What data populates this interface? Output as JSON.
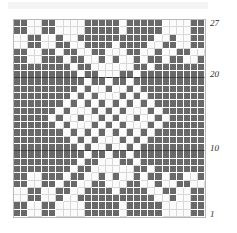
{
  "chart": {
    "columns": 27,
    "rows": 27,
    "colors": {
      "filled": "#696969",
      "empty": "#fbfbfb",
      "gridline": "#ffffff",
      "border": "#b9b9b9",
      "rule": "#3c3c3c",
      "label_text": "#2b2b2b"
    },
    "row_labels": [
      {
        "text": "27",
        "row": 27
      },
      {
        "text": "20",
        "row": 20
      },
      {
        "text": "10",
        "row": 10
      },
      {
        "text": "1",
        "row": 1
      }
    ],
    "emphasis_rule_rows": [
      20,
      10
    ],
    "legend": {
      "filled_meaning": "main colour stitch",
      "empty_meaning": "contrast colour stitch"
    }
  },
  "chart_data": {
    "type": "heatmap",
    "xlabel": "",
    "ylabel": "",
    "x": [
      1,
      2,
      3,
      4,
      5,
      6,
      7,
      8,
      9,
      10,
      11,
      12,
      13,
      14,
      15,
      16,
      17,
      18,
      19,
      20,
      21,
      22,
      23,
      24,
      25,
      26,
      27
    ],
    "categories": [
      1,
      2,
      3,
      4,
      5,
      6,
      7,
      8,
      9,
      10,
      11,
      12,
      13,
      14,
      15,
      16,
      17,
      18,
      19,
      20,
      21,
      22,
      23,
      24,
      25,
      26,
      27
    ],
    "tick_labels_y": [
      "1",
      "10",
      "20",
      "27"
    ],
    "grid": true,
    "legend_position": "none",
    "values_note": "1 = filled (dark) stitch, 0 = empty (light) stitch. Rows listed top (row 27) to bottom (row 1).",
    "values": [
      [
        1,
        1,
        0,
        0,
        1,
        1,
        0,
        0,
        0,
        0,
        1,
        1,
        1,
        1,
        1,
        0,
        1,
        1,
        1,
        1,
        1,
        0,
        0,
        0,
        0,
        1,
        1
      ],
      [
        1,
        1,
        0,
        0,
        1,
        1,
        0,
        0,
        0,
        0,
        1,
        1,
        1,
        1,
        1,
        0,
        1,
        1,
        1,
        1,
        1,
        0,
        0,
        0,
        0,
        1,
        1
      ],
      [
        0,
        0,
        1,
        1,
        0,
        0,
        1,
        0,
        0,
        1,
        1,
        1,
        1,
        1,
        1,
        1,
        1,
        1,
        1,
        1,
        0,
        0,
        1,
        0,
        0,
        1,
        1
      ],
      [
        0,
        0,
        1,
        1,
        0,
        0,
        1,
        1,
        0,
        0,
        1,
        1,
        1,
        1,
        0,
        1,
        1,
        1,
        1,
        0,
        0,
        1,
        1,
        0,
        0,
        1,
        1
      ],
      [
        1,
        1,
        0,
        0,
        1,
        1,
        0,
        1,
        1,
        0,
        0,
        1,
        1,
        0,
        0,
        0,
        1,
        1,
        0,
        0,
        1,
        0,
        0,
        1,
        1,
        0,
        0
      ],
      [
        1,
        1,
        0,
        0,
        1,
        1,
        1,
        0,
        1,
        1,
        0,
        0,
        1,
        0,
        1,
        0,
        0,
        1,
        0,
        1,
        1,
        0,
        1,
        1,
        0,
        0,
        1
      ],
      [
        1,
        1,
        1,
        1,
        1,
        1,
        1,
        1,
        0,
        1,
        1,
        0,
        0,
        0,
        0,
        0,
        0,
        1,
        1,
        0,
        1,
        1,
        1,
        1,
        1,
        1,
        1
      ],
      [
        1,
        1,
        1,
        1,
        1,
        1,
        1,
        1,
        1,
        0,
        1,
        1,
        0,
        0,
        0,
        1,
        1,
        0,
        1,
        1,
        1,
        1,
        1,
        1,
        1,
        1,
        1
      ],
      [
        1,
        1,
        1,
        1,
        1,
        1,
        1,
        1,
        1,
        1,
        0,
        1,
        1,
        0,
        1,
        1,
        0,
        1,
        1,
        1,
        1,
        1,
        1,
        1,
        1,
        1,
        1
      ],
      [
        1,
        1,
        1,
        1,
        1,
        1,
        1,
        1,
        1,
        0,
        1,
        0,
        0,
        1,
        0,
        0,
        1,
        0,
        1,
        1,
        1,
        1,
        1,
        1,
        1,
        1,
        1
      ],
      [
        1,
        1,
        1,
        1,
        1,
        1,
        1,
        1,
        0,
        1,
        0,
        1,
        0,
        0,
        0,
        1,
        0,
        1,
        0,
        1,
        1,
        1,
        1,
        1,
        1,
        1,
        1
      ],
      [
        1,
        1,
        1,
        1,
        1,
        1,
        1,
        0,
        1,
        0,
        1,
        0,
        1,
        0,
        1,
        0,
        1,
        0,
        1,
        0,
        1,
        1,
        1,
        1,
        1,
        1,
        1
      ],
      [
        1,
        1,
        1,
        1,
        1,
        1,
        0,
        1,
        0,
        0,
        0,
        1,
        0,
        1,
        0,
        1,
        0,
        0,
        0,
        1,
        0,
        1,
        1,
        1,
        1,
        1,
        1
      ],
      [
        1,
        1,
        1,
        1,
        1,
        0,
        1,
        0,
        0,
        1,
        0,
        0,
        1,
        0,
        1,
        0,
        0,
        1,
        0,
        0,
        1,
        0,
        1,
        1,
        1,
        1,
        1
      ],
      [
        1,
        1,
        1,
        1,
        1,
        1,
        0,
        1,
        0,
        0,
        0,
        1,
        0,
        1,
        0,
        1,
        0,
        0,
        0,
        1,
        0,
        1,
        1,
        1,
        1,
        1,
        1
      ],
      [
        1,
        1,
        1,
        1,
        1,
        1,
        1,
        0,
        1,
        0,
        1,
        0,
        1,
        0,
        1,
        0,
        1,
        0,
        1,
        0,
        1,
        1,
        1,
        1,
        1,
        1,
        1
      ],
      [
        1,
        1,
        1,
        1,
        1,
        1,
        1,
        1,
        0,
        1,
        0,
        1,
        0,
        0,
        0,
        1,
        0,
        1,
        0,
        1,
        1,
        1,
        1,
        1,
        1,
        1,
        1
      ],
      [
        1,
        1,
        1,
        1,
        1,
        1,
        1,
        1,
        1,
        0,
        1,
        0,
        0,
        1,
        0,
        0,
        1,
        0,
        1,
        1,
        1,
        1,
        1,
        1,
        1,
        1,
        1
      ],
      [
        1,
        1,
        1,
        1,
        1,
        1,
        1,
        1,
        1,
        1,
        0,
        1,
        1,
        0,
        1,
        1,
        0,
        1,
        1,
        1,
        1,
        1,
        1,
        1,
        1,
        1,
        1
      ],
      [
        1,
        1,
        1,
        1,
        1,
        1,
        1,
        1,
        1,
        0,
        1,
        1,
        0,
        0,
        0,
        1,
        1,
        0,
        1,
        1,
        1,
        1,
        1,
        1,
        1,
        1,
        1
      ],
      [
        1,
        1,
        1,
        1,
        1,
        1,
        1,
        1,
        0,
        1,
        1,
        0,
        0,
        0,
        0,
        0,
        0,
        1,
        1,
        0,
        1,
        1,
        1,
        1,
        1,
        1,
        1
      ],
      [
        1,
        1,
        0,
        0,
        1,
        1,
        1,
        0,
        1,
        1,
        0,
        0,
        1,
        0,
        1,
        0,
        0,
        1,
        0,
        1,
        1,
        0,
        1,
        1,
        0,
        0,
        1
      ],
      [
        1,
        1,
        0,
        0,
        1,
        1,
        0,
        1,
        1,
        0,
        0,
        1,
        1,
        0,
        0,
        0,
        1,
        1,
        0,
        0,
        1,
        0,
        0,
        1,
        1,
        0,
        0
      ],
      [
        0,
        0,
        1,
        1,
        0,
        0,
        1,
        1,
        0,
        0,
        1,
        1,
        1,
        1,
        0,
        1,
        1,
        1,
        1,
        0,
        0,
        1,
        1,
        0,
        0,
        1,
        1
      ],
      [
        0,
        0,
        1,
        1,
        0,
        0,
        1,
        0,
        0,
        1,
        1,
        1,
        1,
        1,
        1,
        1,
        1,
        1,
        1,
        1,
        0,
        0,
        1,
        0,
        0,
        1,
        1
      ],
      [
        1,
        1,
        0,
        0,
        1,
        1,
        0,
        0,
        0,
        0,
        1,
        1,
        1,
        1,
        1,
        0,
        1,
        1,
        1,
        1,
        1,
        0,
        0,
        0,
        0,
        1,
        1
      ],
      [
        1,
        1,
        0,
        0,
        1,
        1,
        0,
        0,
        0,
        0,
        1,
        1,
        1,
        1,
        1,
        0,
        1,
        1,
        1,
        1,
        1,
        0,
        0,
        0,
        0,
        1,
        1
      ]
    ]
  }
}
